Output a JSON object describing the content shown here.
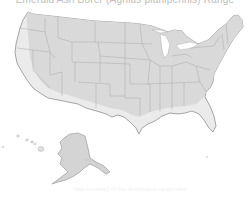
{
  "map": {
    "title": "Emerald Ash Borer (Agrilus planipennis) Range",
    "region": "United States",
    "colors": {
      "background": "#ffffff",
      "interior_fill": "#d9d9d9",
      "coastal_band_fill": "#ebebeb",
      "state_border": "#a8a8a8",
      "outline": "#8f8f8f"
    },
    "insets": [
      "Alaska",
      "Hawaii"
    ],
    "footer_note": "Map courtesy of the distribution range data"
  }
}
